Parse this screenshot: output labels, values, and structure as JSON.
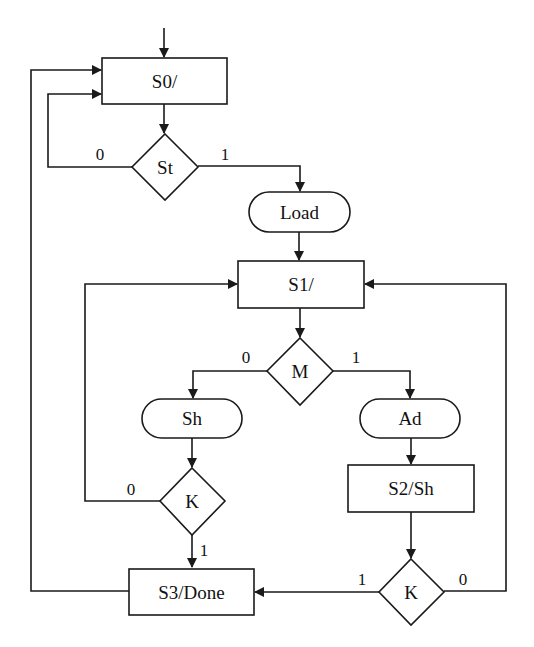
{
  "diagram": {
    "type": "ASM chart (flowchart)",
    "states": [
      {
        "id": "S0",
        "label": "S0/"
      },
      {
        "id": "S1",
        "label": "S1/"
      },
      {
        "id": "S2",
        "label": "S2/Sh"
      },
      {
        "id": "S3",
        "label": "S3/Done"
      }
    ],
    "decisions": [
      {
        "id": "St",
        "label": "St",
        "false_label": "0",
        "true_label": "1"
      },
      {
        "id": "M",
        "label": "M",
        "false_label": "0",
        "true_label": "1"
      },
      {
        "id": "K1",
        "label": "K",
        "false_label": "0",
        "true_label": "1"
      },
      {
        "id": "K2",
        "label": "K",
        "false_label": "0",
        "true_label": "1"
      }
    ],
    "conditional_outputs": [
      {
        "id": "Load",
        "label": "Load"
      },
      {
        "id": "Sh",
        "label": "Sh"
      },
      {
        "id": "Ad",
        "label": "Ad"
      }
    ],
    "edges": [
      {
        "from": "entry",
        "to": "S0"
      },
      {
        "from": "S0",
        "to": "St"
      },
      {
        "from": "St",
        "to": "S0",
        "label": "0"
      },
      {
        "from": "St",
        "to": "Load",
        "label": "1"
      },
      {
        "from": "Load",
        "to": "S1"
      },
      {
        "from": "S1",
        "to": "M"
      },
      {
        "from": "M",
        "to": "Sh",
        "label": "0"
      },
      {
        "from": "M",
        "to": "Ad",
        "label": "1"
      },
      {
        "from": "Sh",
        "to": "K1"
      },
      {
        "from": "K1",
        "to": "S1",
        "label": "0"
      },
      {
        "from": "K1",
        "to": "S3",
        "label": "1"
      },
      {
        "from": "Ad",
        "to": "S2"
      },
      {
        "from": "S2",
        "to": "K2"
      },
      {
        "from": "K2",
        "to": "S3",
        "label": "1"
      },
      {
        "from": "K2",
        "to": "S1",
        "label": "0"
      },
      {
        "from": "S3",
        "to": "S0"
      }
    ]
  }
}
